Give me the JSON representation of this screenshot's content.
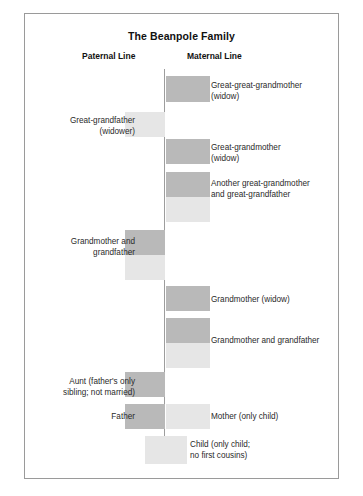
{
  "figure": {
    "title": "The Beanpole Family",
    "paternal_header": "Paternal Line",
    "maternal_header": "Maternal Line",
    "colors": {
      "female_bar": "#b9b9b9",
      "male_bar": "#e6e6e6",
      "center_line": "#9d9d9d",
      "frame": "#9a9a9a",
      "background": "#ffffff",
      "text": "#2a2a2a"
    }
  },
  "generations": [
    {
      "id": "great-great-grandmother",
      "side": "maternal",
      "label": "Great-great-grandmother\n(widow)",
      "bars": [
        {
          "tone": "dark"
        }
      ]
    },
    {
      "id": "great-grandfather",
      "side": "paternal",
      "label": "Great-grandfather\n(widower)",
      "bars": [
        {
          "tone": "light"
        }
      ]
    },
    {
      "id": "great-grandmother",
      "side": "maternal",
      "label": "Great-grandmother\n(widow)",
      "bars": [
        {
          "tone": "dark"
        }
      ]
    },
    {
      "id": "another-great-grandparents",
      "side": "maternal",
      "label": "Another great-grandmother\nand great-grandfather",
      "bars": [
        {
          "tone": "dark"
        },
        {
          "tone": "light"
        }
      ]
    },
    {
      "id": "paternal-grandparents",
      "side": "paternal",
      "label": "Grandmother and\ngrandfather",
      "bars": [
        {
          "tone": "dark"
        },
        {
          "tone": "light"
        }
      ]
    },
    {
      "id": "maternal-grandmother-widow",
      "side": "maternal",
      "label": "Grandmother (widow)",
      "bars": [
        {
          "tone": "dark"
        }
      ]
    },
    {
      "id": "maternal-grandparents",
      "side": "maternal",
      "label": "Grandmother and grandfather",
      "bars": [
        {
          "tone": "dark"
        },
        {
          "tone": "light"
        }
      ]
    },
    {
      "id": "aunt",
      "side": "paternal",
      "label": "Aunt (father's only\nsibling; not married)",
      "bars": [
        {
          "tone": "dark"
        }
      ]
    },
    {
      "id": "father",
      "side": "paternal",
      "label": "Father",
      "bars": [
        {
          "tone": "dark"
        }
      ]
    },
    {
      "id": "mother",
      "side": "maternal",
      "label": "Mother (only child)",
      "bars": [
        {
          "tone": "light"
        }
      ]
    },
    {
      "id": "child",
      "side": "center",
      "label": "Child (only child;\nno first cousins)",
      "bars": [
        {
          "tone": "light"
        }
      ]
    }
  ]
}
